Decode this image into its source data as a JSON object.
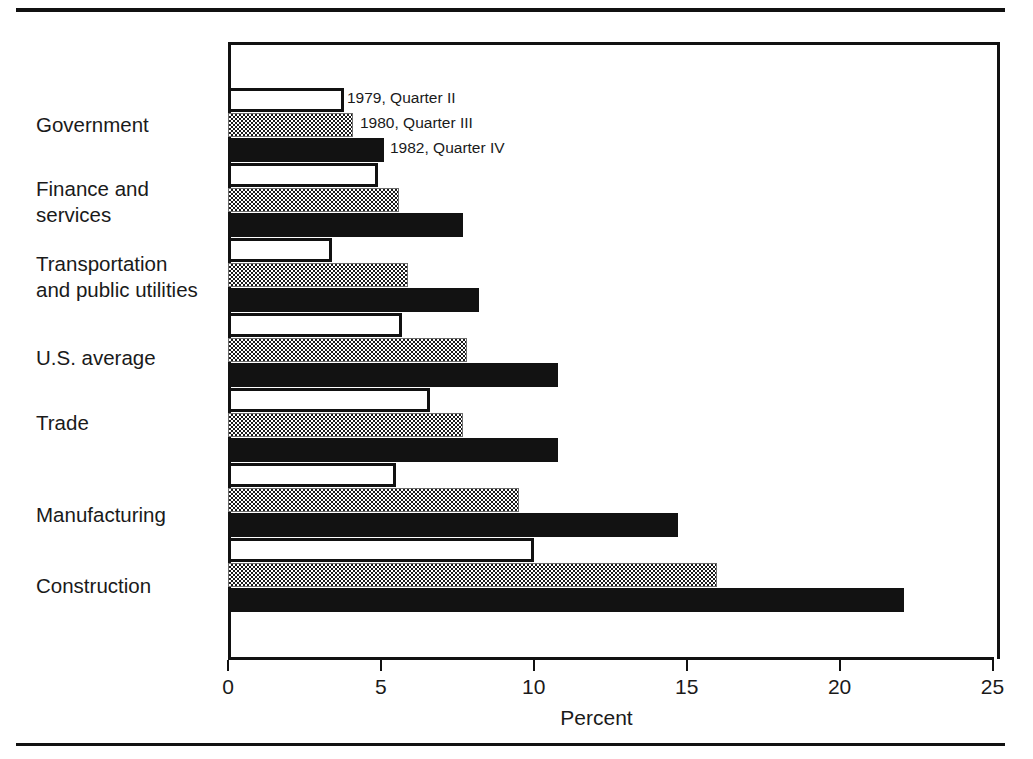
{
  "figure": {
    "axis_title": "Percent",
    "x_ticks": [
      0,
      5,
      10,
      15,
      20,
      25
    ]
  },
  "legend": [
    {
      "label": "1979, Quarter II",
      "swatch": "hollow-white"
    },
    {
      "label": "1980, Quarter III",
      "swatch": "dithered-gray"
    },
    {
      "label": "1982, Quarter IV",
      "swatch": "solid-black"
    }
  ],
  "chart_data": {
    "type": "bar",
    "orientation": "horizontal",
    "title": "",
    "xlabel": "Percent",
    "ylabel": "",
    "xlim": [
      0,
      25
    ],
    "xticks": [
      0,
      5,
      10,
      15,
      20,
      25
    ],
    "grid": false,
    "legend_position": "inside-top-left",
    "categories": [
      "Government",
      "Finance and services",
      "Transportation and public utilities",
      "U.S. average",
      "Trade",
      "Manufacturing",
      "Construction"
    ],
    "series": [
      {
        "name": "1979, Quarter II",
        "values": [
          3.8,
          4.9,
          3.4,
          5.7,
          6.6,
          5.5,
          10.0
        ]
      },
      {
        "name": "1980, Quarter III",
        "values": [
          4.1,
          5.6,
          5.9,
          7.8,
          7.7,
          9.5,
          16.0
        ]
      },
      {
        "name": "1982, Quarter IV",
        "values": [
          5.1,
          7.7,
          8.2,
          10.8,
          10.8,
          14.7,
          22.1
        ]
      }
    ]
  },
  "category_labels": [
    {
      "line1": "Government",
      "line2": ""
    },
    {
      "line1": "Finance and",
      "line2": "services"
    },
    {
      "line1": "Transportation",
      "line2": "and public utilities"
    },
    {
      "line1": "U.S. average",
      "line2": ""
    },
    {
      "line1": "Trade",
      "line2": ""
    },
    {
      "line1": "Manufacturing",
      "line2": ""
    },
    {
      "line1": "Construction",
      "line2": ""
    }
  ]
}
